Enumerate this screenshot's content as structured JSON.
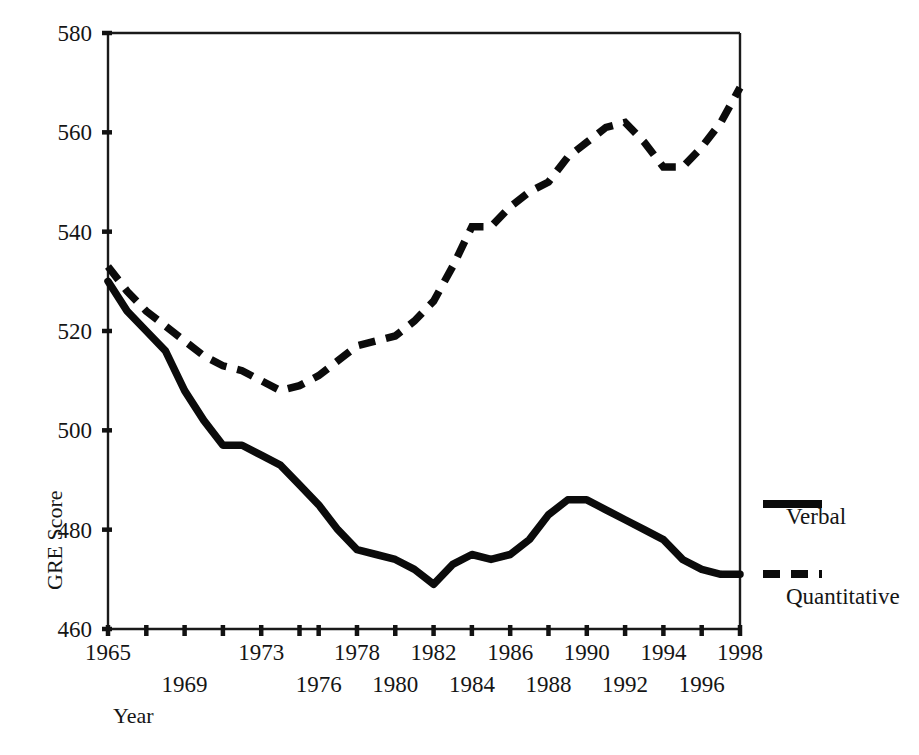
{
  "chart_data": {
    "type": "line",
    "title": "",
    "xlabel": "Year",
    "ylabel": "GRE Score",
    "xlim": [
      1965,
      1998
    ],
    "ylim": [
      460,
      580
    ],
    "grid": false,
    "legend_position": "right",
    "y_ticks": [
      460,
      480,
      500,
      520,
      540,
      560,
      580
    ],
    "y_tick_labels": [
      "460",
      "480",
      "500",
      "520",
      "540",
      "560",
      "580"
    ],
    "x_ticks": [
      1965,
      1967,
      1969,
      1971,
      1973,
      1975,
      1976,
      1978,
      1980,
      1982,
      1984,
      1986,
      1988,
      1990,
      1992,
      1994,
      1996,
      1998
    ],
    "x_tick_labels_row1": [
      "1965",
      "1973",
      "1978",
      "1982",
      "1986",
      "1990",
      "1994",
      "1998"
    ],
    "x_tick_labels_row2": [
      "1969",
      "1976",
      "1980",
      "1984",
      "1988",
      "1992",
      "1996"
    ],
    "x_tick_labels_row1_years": [
      1965,
      1973,
      1978,
      1982,
      1986,
      1990,
      1994,
      1998
    ],
    "x_tick_labels_row2_years": [
      1969,
      1976,
      1980,
      1984,
      1988,
      1992,
      1996
    ],
    "x": [
      1965,
      1966,
      1967,
      1968,
      1969,
      1970,
      1971,
      1972,
      1973,
      1974,
      1975,
      1976,
      1977,
      1978,
      1979,
      1980,
      1981,
      1982,
      1983,
      1984,
      1985,
      1986,
      1987,
      1988,
      1989,
      1990,
      1991,
      1992,
      1993,
      1994,
      1995,
      1996,
      1997,
      1998
    ],
    "series": [
      {
        "name": "Verbal",
        "style": "solid",
        "color": "#0b0b0b",
        "values": [
          530,
          524,
          520,
          516,
          508,
          502,
          497,
          497,
          495,
          493,
          489,
          485,
          480,
          476,
          475,
          474,
          472,
          469,
          473,
          475,
          474,
          475,
          478,
          483,
          486,
          486,
          484,
          482,
          480,
          478,
          474,
          472,
          471,
          471
        ]
      },
      {
        "name": "Quantitative",
        "style": "dashed",
        "color": "#0b0b0b",
        "values": [
          533,
          528,
          524,
          521,
          518,
          515,
          513,
          512,
          510,
          508,
          509,
          511,
          514,
          517,
          518,
          519,
          522,
          526,
          533,
          541,
          541,
          545,
          548,
          550,
          555,
          558,
          561,
          562,
          558,
          553,
          553,
          557,
          562,
          569
        ]
      }
    ]
  },
  "legend": {
    "entries": [
      {
        "label": "Verbal",
        "style": "solid"
      },
      {
        "label": "Quantitative",
        "style": "dashed"
      }
    ]
  },
  "axes": {
    "y_title": "GRE Score",
    "x_title": "Year"
  }
}
